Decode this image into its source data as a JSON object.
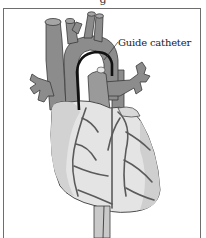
{
  "figure": {
    "caption_remnant": "g",
    "labels": {
      "guide_catheter": "Guide catheter"
    },
    "colors": {
      "vessel": "#8c8c8c",
      "vessel_dark": "#6a6a6a",
      "heart_light": "#e4e4e4",
      "heart_shade": "#c8c8c8",
      "outline": "#3a3a3a",
      "catheter": "#111111",
      "frame": "#6e6e6e"
    }
  }
}
